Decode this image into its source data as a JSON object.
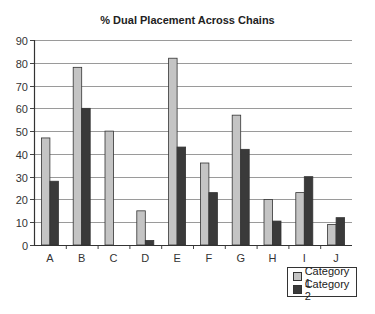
{
  "chart_data": {
    "type": "bar",
    "title": "% Dual Placement Across Chains",
    "xlabel": "",
    "ylabel": "",
    "categories": [
      "A",
      "B",
      "C",
      "D",
      "E",
      "F",
      "G",
      "H",
      "I",
      "J"
    ],
    "series": [
      {
        "name": "Category 1",
        "color": "#c4c4c4",
        "values": [
          47,
          78,
          50,
          15,
          82,
          36,
          57,
          20,
          23,
          9
        ]
      },
      {
        "name": "Category 2",
        "color": "#3a3a3a",
        "values": [
          28,
          60,
          0,
          2,
          43,
          23,
          42,
          10.5,
          30,
          12
        ]
      }
    ],
    "ylim": [
      0,
      90
    ],
    "yticks": [
      0,
      10,
      20,
      30,
      40,
      50,
      60,
      70,
      80,
      90
    ],
    "grid": true,
    "legend_position": "bottom-right"
  },
  "legend": {
    "items": [
      {
        "label": "Category 1",
        "color": "#c4c4c4"
      },
      {
        "label": "Category 2",
        "color": "#3a3a3a"
      }
    ]
  }
}
